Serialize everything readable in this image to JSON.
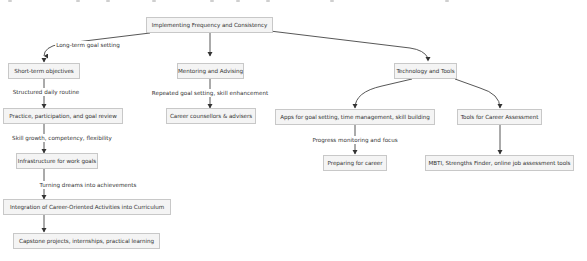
{
  "diagram": {
    "type": "flowchart",
    "root": {
      "id": "root",
      "label": "Implementing Frequency and Consistency"
    },
    "nodes": [
      {
        "id": "root",
        "label": "Implementing Frequency and Consistency"
      },
      {
        "id": "short_term",
        "label": "Short-term objectives"
      },
      {
        "id": "practice",
        "label": "Practice, participation, and goal review"
      },
      {
        "id": "infrastructure",
        "label": "Infrastructure for work goals"
      },
      {
        "id": "integration",
        "label": "Integration of Career-Oriented Activities into Curriculum"
      },
      {
        "id": "capstone",
        "label": "Capstone projects, internships, practical learning"
      },
      {
        "id": "mentoring",
        "label": "Mentoring and Advising"
      },
      {
        "id": "counsellors",
        "label": "Career counsellors & advisers"
      },
      {
        "id": "tech",
        "label": "Technology and Tools"
      },
      {
        "id": "apps",
        "label": "Apps for goal setting, time management, skill building"
      },
      {
        "id": "preparing",
        "label": "Preparing for career"
      },
      {
        "id": "assessment",
        "label": "Tools for Career Assessment"
      },
      {
        "id": "mbti",
        "label": "MBTI, Strengths Finder, online job assessment tools"
      }
    ],
    "edges": [
      {
        "from": "root",
        "to": "short_term",
        "label": "Long-term goal setting"
      },
      {
        "from": "short_term",
        "to": "practice",
        "label": "Structured daily routine"
      },
      {
        "from": "practice",
        "to": "infrastructure",
        "label": "Skill growth, competency, flexibility"
      },
      {
        "from": "infrastructure",
        "to": "integration",
        "label": "Turning dreams into achievements"
      },
      {
        "from": "integration",
        "to": "capstone",
        "label": ""
      },
      {
        "from": "root",
        "to": "mentoring",
        "label": ""
      },
      {
        "from": "mentoring",
        "to": "counsellors",
        "label": "Repeated goal setting, skill enhancement"
      },
      {
        "from": "root",
        "to": "tech",
        "label": ""
      },
      {
        "from": "tech",
        "to": "apps",
        "label": ""
      },
      {
        "from": "apps",
        "to": "preparing",
        "label": "Progress monitoring and focus"
      },
      {
        "from": "tech",
        "to": "assessment",
        "label": ""
      },
      {
        "from": "assessment",
        "to": "mbti",
        "label": ""
      }
    ]
  },
  "colors": {
    "node_fill": "#f4f4f4",
    "node_border": "#c8c8c8",
    "edge": "#444444",
    "text": "#333333"
  }
}
